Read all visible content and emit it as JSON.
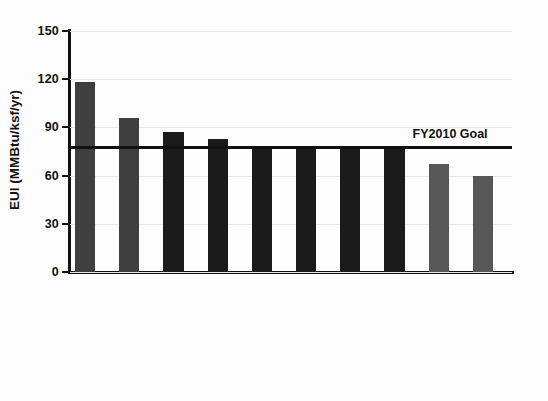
{
  "chart_data": {
    "type": "bar",
    "title": "",
    "xlabel": "",
    "ylabel": "EUI  (MMBtu/ksf/yr)",
    "ylim": [
      0,
      150
    ],
    "yticks": [
      0,
      30,
      60,
      90,
      120,
      150
    ],
    "grid": true,
    "legend": "none",
    "categories": [
      "FY1985 Actual",
      "FY2000 Actual",
      "New Privatized Housing",
      "Replace on Failure",
      "Utilities Modernization",
      "Demolition",
      "New Construction",
      "Barracks Modernization",
      "Combined w/ ESCO Retrofit",
      "Combined w/ Govt. Retrofit"
    ],
    "values": [
      118,
      96,
      87,
      83,
      78,
      78,
      78,
      78,
      67,
      60
    ],
    "bar_colors": [
      "#3f3f3f",
      "#3f3f3f",
      "#1a1a1a",
      "#1a1a1a",
      "#1a1a1a",
      "#1a1a1a",
      "#1a1a1a",
      "#1a1a1a",
      "#575757",
      "#575757"
    ],
    "annotations": [
      {
        "name": "goal-line",
        "label": "FY2010 Goal",
        "value": 78,
        "type": "hline",
        "color": "#111111"
      }
    ]
  },
  "axis": {
    "y_tick_labels": [
      "150",
      "120",
      "90",
      "60",
      "30",
      "0"
    ],
    "y_axis_title": "EUI  (MMBtu/ksf/yr)"
  },
  "colors": {
    "axis": "#111111",
    "grid": "#e6e6e6",
    "background": "#ffffff",
    "bar_dark": "#1a1a1a",
    "bar_medium": "#3f3f3f",
    "bar_gray": "#575757"
  }
}
